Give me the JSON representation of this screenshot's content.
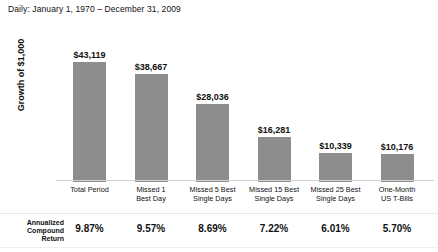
{
  "chart_data": {
    "type": "bar",
    "title": "Daily: January 1, 1970 – December 31, 2009",
    "xlabel": "",
    "ylabel": "Growth of $1,000",
    "ylim": [
      0,
      43119
    ],
    "grid": false,
    "legend": null,
    "categories": [
      "Total Period",
      "Missed 1 Best Day",
      "Missed 5 Best Single Days",
      "Missed 15 Best Single Days",
      "Missed 25 Best Single Days",
      "One-Month US T-Bills"
    ],
    "category_lines": [
      [
        "Total Period",
        ""
      ],
      [
        "Missed 1",
        "Best Day"
      ],
      [
        "Missed 5 Best",
        "Single Days"
      ],
      [
        "Missed 15 Best",
        "Single Days"
      ],
      [
        "Missed 25 Best",
        "Single Days"
      ],
      [
        "One-Month",
        "US T-Bills"
      ]
    ],
    "values": [
      43119,
      38667,
      28036,
      16281,
      10339,
      10176
    ],
    "value_labels": [
      "$43,119",
      "$38,667",
      "$28,036",
      "$16,281",
      "$10,339",
      "$10,176"
    ],
    "bar_color": "#8d8d8d",
    "series": [
      {
        "name": "Growth of $1,000",
        "values": [
          43119,
          38667,
          28036,
          16281,
          10339,
          10176
        ]
      }
    ],
    "annualized_compound_return": [
      9.87,
      9.57,
      8.69,
      7.22,
      6.01,
      5.7
    ],
    "annualized_compound_return_labels": [
      "9.87%",
      "9.57%",
      "8.69%",
      "7.22%",
      "6.01%",
      "5.70%"
    ]
  },
  "table": {
    "row_label_lines": [
      "Annualized",
      "Compound",
      "Return"
    ],
    "values": [
      "9.87%",
      "9.57%",
      "8.69%",
      "7.22%",
      "6.01%",
      "5.70%"
    ]
  }
}
